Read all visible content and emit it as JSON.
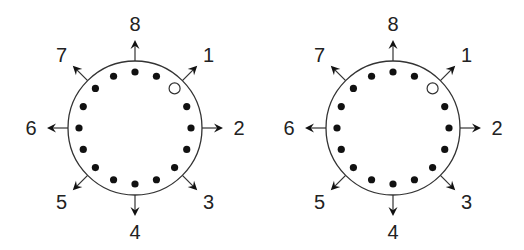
{
  "colors": {
    "background": "#ffffff",
    "stroke": "#333333",
    "dot": "#111111",
    "label": "#222222"
  },
  "diagrams": [
    {
      "id": "left",
      "center": [
        135,
        128
      ],
      "radius": 67,
      "dot_ring_radius": 56,
      "dot_count": 16,
      "dot_radius": 3.6,
      "hollow_dot_index": 2,
      "hollow_dot_radius": 5.5,
      "directions": [
        {
          "label": "1",
          "angle": 45
        },
        {
          "label": "2",
          "angle": 90
        },
        {
          "label": "3",
          "angle": 135
        },
        {
          "label": "4",
          "angle": 180
        },
        {
          "label": "5",
          "angle": 225
        },
        {
          "label": "6",
          "angle": 270
        },
        {
          "label": "7",
          "angle": 315
        },
        {
          "label": "8",
          "angle": 0
        }
      ]
    },
    {
      "id": "right",
      "center": [
        393,
        128
      ],
      "radius": 67,
      "dot_ring_radius": 56,
      "dot_count": 16,
      "dot_radius": 3.6,
      "hollow_dot_index": 2,
      "hollow_dot_radius": 5.5,
      "directions": [
        {
          "label": "1",
          "angle": 45
        },
        {
          "label": "2",
          "angle": 90
        },
        {
          "label": "3",
          "angle": 135
        },
        {
          "label": "4",
          "angle": 180
        },
        {
          "label": "5",
          "angle": 225
        },
        {
          "label": "6",
          "angle": 270
        },
        {
          "label": "7",
          "angle": 315
        },
        {
          "label": "8",
          "angle": 0
        }
      ]
    }
  ],
  "arrow": {
    "length": 21,
    "head_length": 9,
    "head_half_width": 4.5,
    "label_distance": 104,
    "diagonal_label_distance": 104
  }
}
